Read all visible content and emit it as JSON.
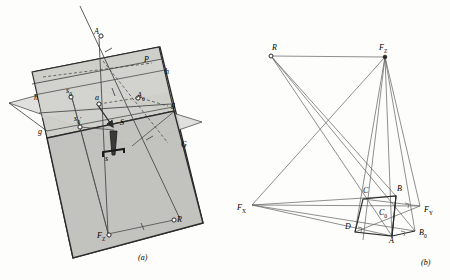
{
  "figure": {
    "caption_a": "(a)",
    "caption_b": "(b)",
    "colors": {
      "ink": "#2b2b2b",
      "thin_line": "#6a6a6a",
      "plane_light": "#d9d9d6",
      "plane_mid": "#c9c9c6",
      "plane_dark": "#b9b9b5",
      "paper": "#fdfdfc"
    }
  },
  "panel_a": {
    "name": "perspective-construction-3d",
    "labels": [
      {
        "id": "A",
        "text": "A",
        "x": 96,
        "y": 33,
        "size": 8
      },
      {
        "id": "P",
        "text": "P",
        "x": 146,
        "y": 61,
        "size": 8
      },
      {
        "id": "h_right",
        "text": "h",
        "x": 166,
        "y": 73,
        "size": 8
      },
      {
        "id": "s0",
        "text": "s",
        "sub": "0",
        "x": 70,
        "y": 92,
        "size": 8
      },
      {
        "id": "a",
        "text": "a",
        "x": 97,
        "y": 99,
        "size": 8
      },
      {
        "id": "A0",
        "text": "A",
        "sub": "0",
        "x": 141,
        "y": 97,
        "size": 8
      },
      {
        "id": "h_left",
        "text": "h",
        "x": 36,
        "y": 99,
        "size": 8
      },
      {
        "id": "g_right",
        "text": "g",
        "x": 172,
        "y": 106,
        "size": 8
      },
      {
        "id": "s0p",
        "text": "s",
        "sub": "0",
        "prime": true,
        "x": 78,
        "y": 120,
        "size": 8
      },
      {
        "id": "S",
        "text": "S",
        "x": 122,
        "y": 124,
        "size": 8
      },
      {
        "id": "g_left",
        "text": "g",
        "x": 40,
        "y": 133,
        "size": 8
      },
      {
        "id": "G",
        "text": "G",
        "x": 183,
        "y": 146,
        "size": 8
      },
      {
        "id": "s",
        "text": "s",
        "x": 107,
        "y": 160,
        "size": 8
      },
      {
        "id": "R",
        "text": "R",
        "x": 178,
        "y": 221,
        "size": 8
      },
      {
        "id": "FZ",
        "text": "F",
        "sub": "Z",
        "x": 100,
        "y": 237,
        "size": 8
      }
    ]
  },
  "panel_b": {
    "name": "perspective-construction-2d",
    "labels": [
      {
        "id": "R",
        "text": "R",
        "x": 274,
        "y": 49,
        "size": 8
      },
      {
        "id": "FZ",
        "text": "F",
        "sub": "Z",
        "x": 382,
        "y": 50,
        "size": 8
      },
      {
        "id": "C",
        "text": "C",
        "x": 365,
        "y": 192,
        "size": 8
      },
      {
        "id": "B",
        "text": "B",
        "x": 399,
        "y": 190,
        "size": 8
      },
      {
        "id": "FX",
        "text": "F",
        "sub": "X",
        "x": 240,
        "y": 209,
        "size": 8
      },
      {
        "id": "FY",
        "text": "F",
        "sub": "Y",
        "x": 427,
        "y": 211,
        "size": 8
      },
      {
        "id": "C0",
        "text": "C",
        "sub": "0",
        "x": 381,
        "y": 214,
        "size": 8
      },
      {
        "id": "D",
        "text": "D",
        "x": 348,
        "y": 228,
        "size": 8
      },
      {
        "id": "A",
        "text": "A",
        "x": 390,
        "y": 241,
        "size": 8
      },
      {
        "id": "B0",
        "text": "B",
        "sub": "0",
        "x": 421,
        "y": 235,
        "size": 8
      }
    ],
    "points": {
      "R": [
        270,
        55
      ],
      "FZ": [
        385,
        57
      ],
      "FX": [
        252,
        205
      ],
      "FY": [
        420,
        206
      ],
      "C": [
        363,
        199
      ],
      "B": [
        396,
        196
      ],
      "D": [
        355,
        232
      ],
      "A": [
        392,
        236
      ],
      "B0": [
        415,
        231
      ],
      "C0": [
        377,
        219
      ]
    }
  }
}
